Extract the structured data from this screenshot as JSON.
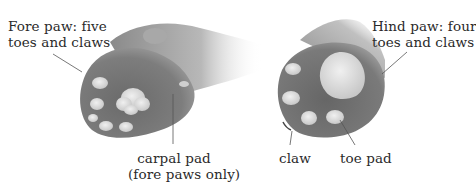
{
  "diagram": {
    "fore_paw": {
      "label_line1": "Fore paw: five",
      "label_line2": "toes and claws",
      "toe_count": 5
    },
    "hind_paw": {
      "label_line1": "Hind paw: four",
      "label_line2": "toes and claws",
      "toe_count": 4
    },
    "callouts": {
      "carpal_pad_line1": "carpal pad",
      "carpal_pad_line2": "(fore paws only)",
      "claw": "claw",
      "toe_pad": "toe pad"
    },
    "colors": {
      "fur_dark": "#5a5a5a",
      "fur_mid": "#8c8c8c",
      "fur_light": "#cfcfcf",
      "pad": "#d9d9d9",
      "pad_highlight": "#eeeeee",
      "leader_line": "#555555",
      "text": "#2a2a2a"
    }
  }
}
